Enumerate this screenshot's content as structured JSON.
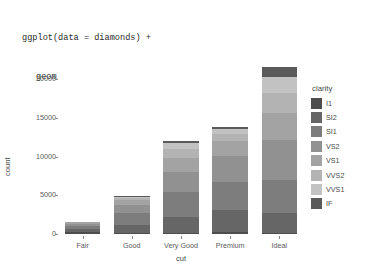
{
  "code": {
    "line1": "ggplot(data = diamonds) +",
    "line2": "geom_bar(mapping = aes(x = cut, fill = clarity))"
  },
  "legend": {
    "title": "clarity",
    "items": [
      {
        "label": "I1",
        "color": "#4d4d4d"
      },
      {
        "label": "SI2",
        "color": "#666666"
      },
      {
        "label": "SI1",
        "color": "#7d7d7d"
      },
      {
        "label": "VS2",
        "color": "#919191"
      },
      {
        "label": "VS1",
        "color": "#a3a3a3"
      },
      {
        "label": "VVS2",
        "color": "#b3b3b3"
      },
      {
        "label": "VVS1",
        "color": "#c2c2c2"
      },
      {
        "label": "IF",
        "color": "#5a5a5a"
      }
    ]
  },
  "chart_data": {
    "type": "bar",
    "stacked": true,
    "title": "",
    "xlabel": "cut",
    "ylabel": "count",
    "categories": [
      "Fair",
      "Good",
      "Very Good",
      "Premium",
      "Ideal"
    ],
    "ytick_labels": [
      "0",
      "5000",
      "10000",
      "15000",
      "20000"
    ],
    "ytick_values": [
      0,
      5000,
      10000,
      15000,
      20000
    ],
    "ylim": [
      0,
      22500
    ],
    "grid": false,
    "legend_position": "right",
    "series": [
      {
        "name": "I1",
        "color": "#4d4d4d",
        "values": [
          210,
          96,
          84,
          205,
          146
        ]
      },
      {
        "name": "SI2",
        "color": "#666666",
        "values": [
          466,
          1081,
          2100,
          2949,
          2598
        ]
      },
      {
        "name": "SI1",
        "color": "#7d7d7d",
        "values": [
          408,
          1560,
          3240,
          3575,
          4282
        ]
      },
      {
        "name": "VS2",
        "color": "#919191",
        "values": [
          261,
          978,
          2591,
          3357,
          5071
        ]
      },
      {
        "name": "VS1",
        "color": "#a3a3a3",
        "values": [
          170,
          648,
          1775,
          1989,
          3589
        ]
      },
      {
        "name": "VVS2",
        "color": "#b3b3b3",
        "values": [
          69,
          286,
          1235,
          870,
          2606
        ]
      },
      {
        "name": "VVS1",
        "color": "#c2c2c2",
        "values": [
          17,
          186,
          789,
          616,
          2047
        ]
      },
      {
        "name": "IF",
        "color": "#5a5a5a",
        "values": [
          9,
          71,
          268,
          230,
          1212
        ]
      }
    ],
    "totals": [
      1610,
      4906,
      12082,
      13791,
      21551
    ]
  }
}
